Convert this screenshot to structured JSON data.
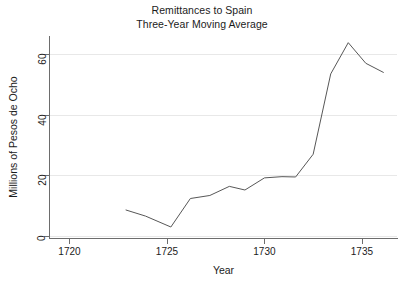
{
  "chart_data": {
    "type": "line",
    "title": "Remittances to Spain",
    "subtitle": "Three-Year Moving Average",
    "xlabel": "Year",
    "ylabel": "Millions of Pesos de Ocho",
    "xlim": [
      1719.0,
      1736.8
    ],
    "ylim": [
      -0.3,
      66.0
    ],
    "xticks": [
      1720,
      1725,
      1730,
      1735
    ],
    "xticklabels": [
      "1720",
      "1725",
      "1730",
      "1735"
    ],
    "yticks": [
      0,
      20,
      40,
      60
    ],
    "yticklabels": [
      "0",
      "20",
      "40",
      "60"
    ],
    "grid": "horizontal",
    "legend": "none",
    "series": [
      {
        "name": "Remittances to Spain (3-yr moving average)",
        "color": "#575757",
        "x": [
          1722.9,
          1723.9,
          1725.2,
          1726.2,
          1727.2,
          1728.2,
          1729.0,
          1730.0,
          1730.9,
          1731.6,
          1732.5,
          1733.4,
          1734.3,
          1735.2,
          1736.1
        ],
        "values": [
          8.6,
          6.6,
          3.0,
          12.4,
          13.4,
          16.4,
          15.2,
          19.2,
          19.6,
          19.5,
          27.0,
          53.5,
          63.8,
          57.0,
          54.0
        ]
      }
    ]
  }
}
